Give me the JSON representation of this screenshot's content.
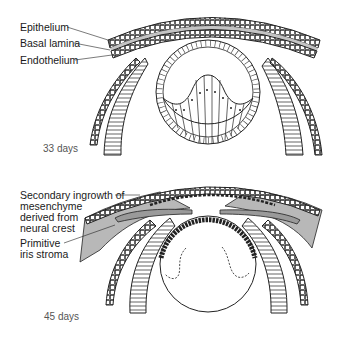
{
  "figure": {
    "panel_top": {
      "stage_label": "33 days",
      "labels": {
        "epithelium": "Epithelium",
        "basal_lamina": "Basal lamina",
        "endothelium": "Endothelium"
      }
    },
    "panel_bottom": {
      "stage_label": "45 days",
      "labels": {
        "secondary_ingrowth_1": "Secondary ingrowth of",
        "secondary_ingrowth_2": "mesenchyme",
        "secondary_ingrowth_3": "derived from",
        "secondary_ingrowth_4": "neural crest",
        "primitive_iris_1": "Primitive",
        "primitive_iris_2": "iris stroma"
      }
    },
    "colors": {
      "line": "#1a1a1a",
      "shading": "#b8b8b8",
      "lamina": "#c8c8c8"
    }
  }
}
